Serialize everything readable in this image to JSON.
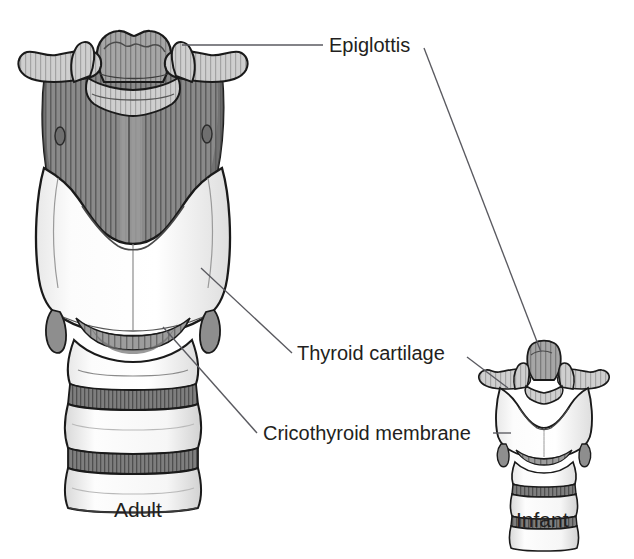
{
  "figure": {
    "title_visible": false,
    "background_color": "#ffffff",
    "ink_color": "#231f20",
    "leader_line_color": "#5a5a60",
    "panels": [
      {
        "id": "adult",
        "caption": "Adult"
      },
      {
        "id": "infant",
        "caption": "Infant"
      }
    ],
    "labels": [
      {
        "id": "epiglottis",
        "text": "Epiglottis",
        "text_x": 329,
        "text_y": 52,
        "leaders": [
          {
            "from_x": 182,
            "from_y": 45,
            "to_x": 323,
            "to_y": 45
          },
          {
            "from_x": 424,
            "from_y": 48,
            "to_x": 541,
            "to_y": 352
          }
        ]
      },
      {
        "id": "thyroid-cartilage",
        "text": "Thyroid cartilage",
        "text_x": 297,
        "text_y": 360,
        "leaders": [
          {
            "from_x": 201,
            "from_y": 268,
            "to_x": 292,
            "to_y": 353
          },
          {
            "from_x": 467,
            "from_y": 357,
            "to_x": 508,
            "to_y": 388
          }
        ]
      },
      {
        "id": "cricothyroid-membrane",
        "text": "Cricothyroid membrane",
        "text_x": 263,
        "text_y": 440,
        "leaders": [
          {
            "from_x": 163,
            "from_y": 327,
            "to_x": 257,
            "to_y": 433
          },
          {
            "from_x": 493,
            "from_y": 433,
            "to_x": 511,
            "to_y": 433
          }
        ]
      }
    ],
    "captions": [
      {
        "id": "adult-caption",
        "text": "Adult",
        "x": 114,
        "y": 517
      },
      {
        "id": "infant-caption",
        "text": "Infant",
        "x": 516,
        "y": 527
      }
    ],
    "palette": {
      "cartilage_white": "#fbfbfb",
      "cartilage_shadow": "#e2e2e2",
      "membrane_gray": "#8d8d8d",
      "membrane_dark": "#6e6e6e",
      "hyoid_light": "#c9c9c9",
      "epiglottis_gray": "#9a9a9a",
      "outline": "#1a1a1a"
    },
    "structures": [
      {
        "id": "epiglottis-adult",
        "name": "epiglottis"
      },
      {
        "id": "hyoid-bone-adult",
        "name": "hyoid bone"
      },
      {
        "id": "thyrohyoid-membrane-adult",
        "name": "thyrohyoid membrane"
      },
      {
        "id": "thyroid-cartilage-adult",
        "name": "thyroid cartilage"
      },
      {
        "id": "cricothyroid-membrane-adult",
        "name": "cricothyroid membrane"
      },
      {
        "id": "cricoid-cartilage-adult",
        "name": "cricoid cartilage"
      },
      {
        "id": "tracheal-rings-adult",
        "name": "tracheal rings"
      },
      {
        "id": "epiglottis-infant",
        "name": "epiglottis"
      },
      {
        "id": "hyoid-bone-infant",
        "name": "hyoid bone"
      },
      {
        "id": "thyroid-cartilage-infant",
        "name": "thyroid cartilage"
      },
      {
        "id": "cricothyroid-membrane-infant",
        "name": "cricothyroid membrane"
      },
      {
        "id": "tracheal-rings-infant",
        "name": "tracheal rings"
      }
    ]
  }
}
